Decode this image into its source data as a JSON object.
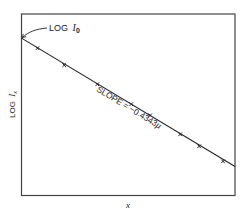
{
  "chart_data": {
    "type": "line",
    "title": "",
    "xlabel": "x",
    "ylabel_prefix": "LOG",
    "ylabel_var": "I",
    "ylabel_sub": "x",
    "xlim": [
      0,
      1
    ],
    "ylim": [
      0,
      1
    ],
    "units_note": "schematic; no numeric ticks shown — values normalized to axis range",
    "grid": false,
    "trend_line": {
      "x": [
        0,
        1
      ],
      "y": [
        0.867,
        0.16
      ]
    },
    "series": [
      {
        "name": "measured points",
        "marker": "x",
        "x": [
          0.075,
          0.2,
          0.355,
          0.514,
          0.603,
          0.743,
          0.832,
          0.944
        ],
        "y": [
          0.812,
          0.718,
          0.613,
          0.503,
          0.442,
          0.337,
          0.271,
          0.188
        ]
      }
    ],
    "annotations": {
      "intercept_prefix": "LOG",
      "intercept_var": "I",
      "intercept_sub": "0",
      "slope_text": "SLOPE = −0.4343",
      "slope_symbol": "μ"
    }
  }
}
